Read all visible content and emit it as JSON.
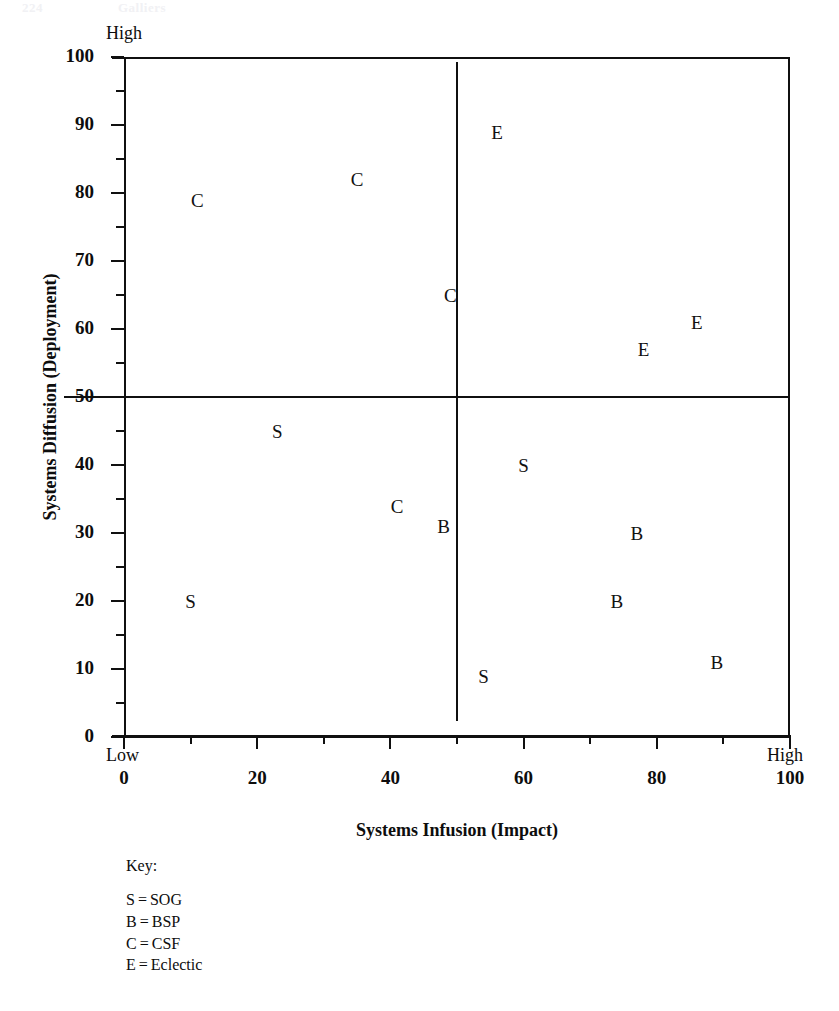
{
  "page_header": {
    "folio": "224",
    "running_head": "Galliers"
  },
  "chart_data": {
    "type": "scatter",
    "title": "",
    "xlabel": "Systems Infusion (Impact)",
    "ylabel": "Systems Diffusion (Deployment)",
    "xlim": [
      0,
      100
    ],
    "ylim": [
      0,
      100
    ],
    "grid": false,
    "x_major_ticks": [
      0,
      20,
      40,
      60,
      80,
      100
    ],
    "x_minor_ticks": [
      10,
      30,
      50,
      70,
      90
    ],
    "x_tick_labels": [
      "0",
      "20",
      "40",
      "60",
      "80",
      "100"
    ],
    "y_major_ticks": [
      0,
      10,
      20,
      30,
      40,
      50,
      60,
      70,
      80,
      90,
      100
    ],
    "y_tick_labels": [
      "0",
      "10",
      "20",
      "30",
      "40",
      "50",
      "60",
      "70",
      "80",
      "90",
      "100"
    ],
    "y_minor_ticks": [
      5,
      15,
      25,
      35,
      45,
      55,
      65,
      75,
      85,
      95
    ],
    "axis_end_labels": {
      "y_high": "High",
      "x_low": "Low",
      "x_high": "High"
    },
    "quadrant_dividers": {
      "vertical_x": 50,
      "horizontal_y": 50
    },
    "legend_position": "below-left",
    "points": [
      {
        "label": "C",
        "x": 11,
        "y": 79
      },
      {
        "label": "C",
        "x": 35,
        "y": 82
      },
      {
        "label": "C",
        "x": 49,
        "y": 65
      },
      {
        "label": "C",
        "x": 41,
        "y": 34
      },
      {
        "label": "E",
        "x": 56,
        "y": 89
      },
      {
        "label": "E",
        "x": 86,
        "y": 61
      },
      {
        "label": "E",
        "x": 78,
        "y": 57
      },
      {
        "label": "S",
        "x": 23,
        "y": 45
      },
      {
        "label": "S",
        "x": 10,
        "y": 20
      },
      {
        "label": "S",
        "x": 60,
        "y": 40
      },
      {
        "label": "S",
        "x": 54,
        "y": 9
      },
      {
        "label": "B",
        "x": 48,
        "y": 31
      },
      {
        "label": "B",
        "x": 77,
        "y": 30
      },
      {
        "label": "B",
        "x": 74,
        "y": 20
      },
      {
        "label": "B",
        "x": 89,
        "y": 11
      }
    ]
  },
  "key": {
    "title": "Key:",
    "entries": [
      {
        "symbol": "S",
        "eq": "=",
        "name": "SOG"
      },
      {
        "symbol": "B",
        "eq": "=",
        "name": "BSP"
      },
      {
        "symbol": "C",
        "eq": "=",
        "name": "CSF"
      },
      {
        "symbol": "E",
        "eq": "=",
        "name": "Eclectic"
      }
    ]
  },
  "colors": {
    "ink": "#101010",
    "background": "#ffffff"
  }
}
